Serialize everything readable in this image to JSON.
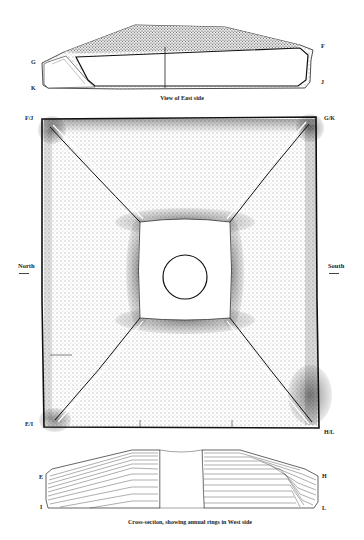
{
  "figure": {
    "east_view": {
      "caption": "View of East side",
      "labels": {
        "G": "G",
        "K": "K",
        "F": "F",
        "J": "J"
      }
    },
    "plan_view": {
      "corner_labels": {
        "top_left": "F/J",
        "top_right": "G/K",
        "bottom_left": "E/I",
        "bottom_right": "H/L"
      },
      "orientation": {
        "left": "North",
        "right": "South"
      }
    },
    "cross_section": {
      "caption": "Cross-section, showing annual rings in West side",
      "labels": {
        "E": "E",
        "I": "I",
        "H": "H",
        "L": "L"
      }
    },
    "colors": {
      "ink": "#111111",
      "stipple": "#3a3a3a",
      "paper": "#ffffff"
    }
  }
}
